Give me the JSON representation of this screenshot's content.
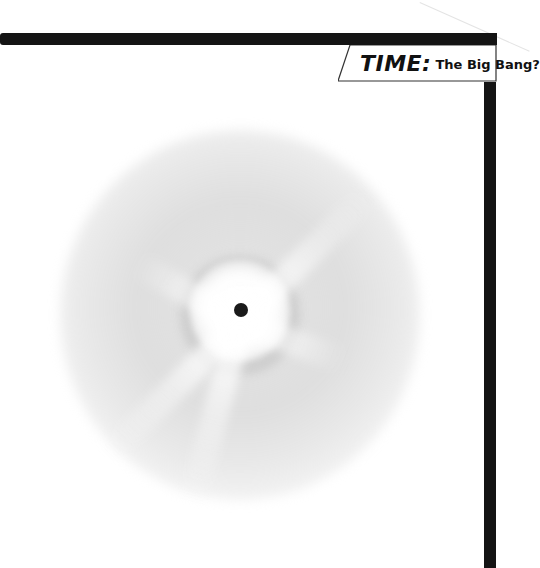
{
  "header": {
    "label_prefix": "TIME:",
    "label_title": "The Big Bang?"
  },
  "illustration": {
    "subject": "big-bang-explosion",
    "center_point": "singularity-dot",
    "colors": {
      "frame": "#141414",
      "cloud": "#c8c8c8",
      "core": "#ffffff",
      "dot": "#1a1a1a"
    }
  }
}
